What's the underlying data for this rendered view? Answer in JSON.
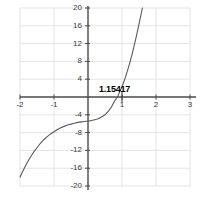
{
  "chart_data": {
    "type": "line",
    "title": "",
    "xlabel": "",
    "ylabel": "",
    "xlim": [
      -2,
      3
    ],
    "ylim": [
      -20,
      20
    ],
    "grid": true,
    "legend": null,
    "xticks": [
      -2,
      -1,
      1,
      2,
      3
    ],
    "xtick_labels": [
      "-2",
      "-1",
      "1",
      "2",
      "3"
    ],
    "yticks": [
      20,
      16,
      12,
      8,
      4,
      -4,
      -8,
      -12,
      -16,
      -20
    ],
    "ytick_labels": [
      "20",
      "16",
      "12",
      "8",
      "4",
      "-4",
      "-8",
      "-12",
      "-16",
      "-20"
    ],
    "annotations": [
      {
        "text": "1.15417",
        "x": 1.15417,
        "y": 0
      }
    ],
    "series": [
      {
        "name": "curve",
        "color": "#5a5a5a",
        "x": [
          -2.0,
          -1.9,
          -1.8,
          -1.7,
          -1.6,
          -1.5,
          -1.4,
          -1.3,
          -1.2,
          -1.1,
          -1.0,
          -0.9,
          -0.8,
          -0.7,
          -0.6,
          -0.5,
          -0.4,
          -0.3,
          -0.2,
          -0.1,
          0.0,
          0.1,
          0.2,
          0.3,
          0.4,
          0.5,
          0.6,
          0.7,
          0.8,
          0.87,
          0.9,
          1.0,
          1.1,
          1.2,
          1.3,
          1.4,
          1.5,
          1.6,
          1.7,
          1.8,
          1.9,
          2.0
        ],
        "y": [
          -18.0,
          -16.4,
          -14.9,
          -13.6,
          -12.4,
          -11.4,
          -10.4,
          -9.6,
          -8.9,
          -8.3,
          -7.8,
          -7.3,
          -6.9,
          -6.6,
          -6.3,
          -6.1,
          -5.9,
          -5.7,
          -5.6,
          -5.5,
          -5.4,
          -5.3,
          -5.1,
          -4.9,
          -4.5,
          -4.0,
          -3.2,
          -2.1,
          -0.7,
          0.0,
          0.6,
          2.3,
          4.4,
          6.9,
          9.7,
          12.9,
          16.4,
          20.0,
          23.9,
          28.1,
          32.5,
          37.2
        ]
      }
    ]
  },
  "axes_geometry": {
    "plot_left_px": 20,
    "plot_right_px": 190,
    "plot_top_px": 8,
    "plot_bottom_px": 186,
    "x_axis_y_px": 97,
    "y_axis_x_px": 88,
    "px_per_x_unit": 34,
    "px_per_y_unit": 4.45
  },
  "colors": {
    "grid": "#e4e4e4",
    "axis": "#4a4a4a",
    "curve": "#5a5a5a",
    "text": "#3a3a3a",
    "background": "#ffffff"
  }
}
